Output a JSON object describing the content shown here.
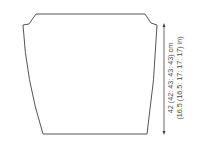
{
  "diagram": {
    "type": "knitting-schematic",
    "piece": "garment panel",
    "stroke_color": "#555555",
    "measurement": {
      "line1": "42 (42: 43: 43: 43) cm",
      "line2": "(16.5 (16.5: 17: 17: 17) in)"
    }
  }
}
